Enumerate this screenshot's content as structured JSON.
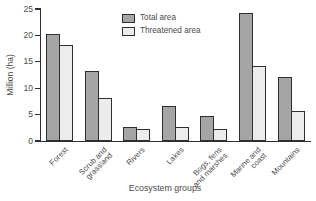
{
  "chart_data": {
    "type": "bar",
    "title": "",
    "categories": [
      "Forest",
      "Scrub and\ngrassland",
      "Rivers",
      "Lakes",
      "Bogs, fens\nand marshes",
      "Marine and\ncoast",
      "Mountains"
    ],
    "series": [
      {
        "name": "Total area",
        "values": [
          20,
          13,
          2.5,
          6.5,
          4.5,
          24,
          12
        ],
        "color": "#a5a5a5"
      },
      {
        "name": "Threatened area",
        "values": [
          18,
          8,
          2,
          2.5,
          2,
          14,
          5.5
        ],
        "color": "#ececec"
      }
    ],
    "xlabel": "Ecosystem groups",
    "ylabel": "Million (ha)",
    "ylim": [
      0,
      25
    ],
    "yticks": [
      0,
      5,
      10,
      15,
      20,
      25
    ],
    "grid": false,
    "legend_position": "inside-top-center",
    "colors": {
      "bar_border": "#2f2f2f",
      "axis": "#2f2f2f",
      "text": "#4a4a4a",
      "background": "#ffffff"
    }
  }
}
